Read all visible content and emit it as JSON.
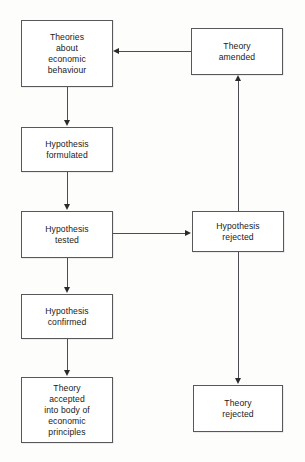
{
  "diagram": {
    "background_color": "#fdfdfc",
    "box_border_color": "#58585a",
    "line_color": "#4d4d4f",
    "text_color": "#1a1a1a",
    "nodes": [
      {
        "id": "theories",
        "label": "Theories\nabout\neconomic\nbehaviour",
        "lines": [
          "Theories",
          "about",
          "economic",
          "behaviour"
        ],
        "x": 21,
        "y": 20,
        "w": 92,
        "h": 67
      },
      {
        "id": "theory-amended",
        "label": "Theory\namended",
        "lines": [
          "Theory",
          "amended"
        ],
        "x": 191,
        "y": 28,
        "w": 92,
        "h": 47
      },
      {
        "id": "hypothesis-formulated",
        "label": "Hypothesis\nformulated",
        "lines": [
          "Hypothesis",
          "formulated"
        ],
        "x": 21,
        "y": 127,
        "w": 92,
        "h": 45
      },
      {
        "id": "hypothesis-tested",
        "label": "Hypothesis\ntested",
        "lines": [
          "Hypothesis",
          "tested"
        ],
        "x": 21,
        "y": 211,
        "w": 92,
        "h": 47
      },
      {
        "id": "hypothesis-rejected",
        "label": "Hypothesis\nrejected",
        "lines": [
          "Hypothesis",
          "rejected"
        ],
        "x": 192,
        "y": 211,
        "w": 92,
        "h": 41
      },
      {
        "id": "hypothesis-confirmed",
        "label": "Hypothesis\nconfirmed",
        "lines": [
          "Hypothesis",
          "confirmed"
        ],
        "x": 21,
        "y": 294,
        "w": 92,
        "h": 45
      },
      {
        "id": "theory-accepted",
        "label": "Theory\naccepted\ninto body of\neconomic\nprinciples",
        "lines": [
          "Theory",
          "accepted",
          "into body of",
          "economic",
          "principles"
        ],
        "x": 21,
        "y": 377,
        "w": 92,
        "h": 66
      },
      {
        "id": "theory-rejected",
        "label": "Theory\nrejected",
        "lines": [
          "Theory",
          "rejected"
        ],
        "x": 193,
        "y": 385,
        "w": 90,
        "h": 47
      }
    ],
    "edges": [
      {
        "id": "theories-to-formulated",
        "from": "theories",
        "to": "hypothesis-formulated",
        "direction": "down"
      },
      {
        "id": "formulated-to-tested",
        "from": "hypothesis-formulated",
        "to": "hypothesis-tested",
        "direction": "down"
      },
      {
        "id": "tested-to-rejected",
        "from": "hypothesis-tested",
        "to": "hypothesis-rejected",
        "direction": "right"
      },
      {
        "id": "tested-to-confirmed",
        "from": "hypothesis-tested",
        "to": "hypothesis-confirmed",
        "direction": "down"
      },
      {
        "id": "confirmed-to-accepted",
        "from": "hypothesis-confirmed",
        "to": "theory-accepted",
        "direction": "down"
      },
      {
        "id": "rejected-to-amended",
        "from": "hypothesis-rejected",
        "to": "theory-amended",
        "direction": "up"
      },
      {
        "id": "rejected-to-theory-rejected",
        "from": "hypothesis-rejected",
        "to": "theory-rejected",
        "direction": "down"
      },
      {
        "id": "amended-to-theories",
        "from": "theory-amended",
        "to": "theories",
        "direction": "left"
      }
    ]
  }
}
